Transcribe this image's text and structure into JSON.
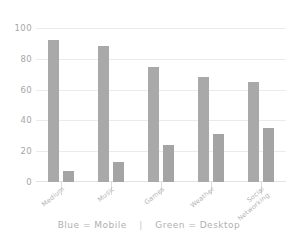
{
  "chart_data": {
    "type": "bar",
    "title": "",
    "subtitle": "",
    "xlabel": "",
    "ylabel": "",
    "ylim": [
      0,
      100
    ],
    "yticks": [
      0,
      20,
      40,
      60,
      80,
      100
    ],
    "grid": true,
    "legend_position": "bottom-center",
    "categories": [
      "Medium",
      "Music",
      "Games",
      "Weather",
      "Social Networking"
    ],
    "series": [
      {
        "name": "Mobile",
        "color": "#a9a9a9",
        "values": [
          92,
          88,
          75,
          68,
          65
        ]
      },
      {
        "name": "Desktop",
        "color": "#a4a4a4",
        "values": [
          7,
          13,
          24,
          31,
          35
        ]
      }
    ],
    "annotations": [
      "Blue = Mobile  |  Green = Desktop"
    ]
  },
  "axes": {
    "y": {
      "ticks": [
        {
          "label": "100",
          "value": 100
        },
        {
          "label": "80",
          "value": 80
        },
        {
          "label": "60",
          "value": 60
        },
        {
          "label": "40",
          "value": 40
        },
        {
          "label": "20",
          "value": 20
        },
        {
          "label": "0",
          "value": 0
        }
      ]
    },
    "x": {
      "ticks": [
        {
          "line1": "Medium",
          "line2": ""
        },
        {
          "line1": "Music",
          "line2": ""
        },
        {
          "line1": "Games",
          "line2": ""
        },
        {
          "line1": "Weather",
          "line2": ""
        },
        {
          "line1": "Social",
          "line2": "Networking"
        }
      ]
    }
  },
  "legend": {
    "mobile_text": "Blue = Mobile",
    "separator": "|",
    "desktop_text": "Green = Desktop"
  },
  "colors": {
    "bar_mobile": "#a9a9a9",
    "bar_desktop": "#a4a4a4",
    "gridline": "#ebebeb",
    "axis": "#e2e2e2",
    "text": "#a6a6a6",
    "background": "#ffffff"
  }
}
